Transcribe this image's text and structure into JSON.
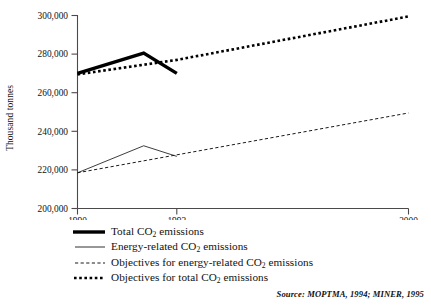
{
  "figure": {
    "source_note": "Source: MOPTMA, 1994; MINER, 1995"
  },
  "chart_data": {
    "type": "line",
    "title": "",
    "xlabel": "",
    "ylabel": "Thousand tonnes",
    "xlim": [
      1990,
      2000
    ],
    "ylim": [
      200000,
      300000
    ],
    "grid": false,
    "legend_position": "below",
    "xticks": [
      1990,
      1993,
      2000
    ],
    "xtick_labels": [
      "1990",
      "1993",
      "2000"
    ],
    "yticks": [
      200000,
      220000,
      240000,
      260000,
      280000,
      300000
    ],
    "ytick_labels": [
      "200,000",
      "220,000",
      "240,000",
      "260,000",
      "280,000",
      "300,000"
    ],
    "series": [
      {
        "name": "Total CO2 emissions",
        "legend_label": "Total CO₂ emissions",
        "style": "thick-solid",
        "x": [
          1990,
          1992,
          1993
        ],
        "values": [
          270000,
          280500,
          270000
        ]
      },
      {
        "name": "Energy-related CO2 emissions",
        "legend_label": "Energy-related CO₂ emissions",
        "style": "thin-solid",
        "x": [
          1990,
          1992,
          1993
        ],
        "values": [
          218500,
          232500,
          227000
        ]
      },
      {
        "name": "Objectives for energy-related CO2 emissions",
        "legend_label": "Objectives for energy-related CO₂ emissions",
        "style": "thin-dashed",
        "x": [
          1990,
          2000
        ],
        "values": [
          218500,
          249500
        ]
      },
      {
        "name": "Objectives for total CO2 emissions",
        "legend_label": "Objectives for total CO₂ emissions",
        "style": "thick-dotted",
        "x": [
          1990,
          1993,
          2000
        ],
        "values": [
          269500,
          277000,
          299500
        ]
      }
    ]
  },
  "legend": {
    "items": [
      {
        "label_pre": "Total CO",
        "sub": "2",
        "label_post": " emissions",
        "key": "thick-solid"
      },
      {
        "label_pre": "Energy-related CO",
        "sub": "2",
        "label_post": " emissions",
        "key": "thin-solid"
      },
      {
        "label_pre": "Objectives for energy-related CO",
        "sub": "2",
        "label_post": " emissions",
        "key": "thin-dashed"
      },
      {
        "label_pre": "Objectives for total CO",
        "sub": "2",
        "label_post": " emissions",
        "key": "thick-dotted"
      }
    ]
  }
}
